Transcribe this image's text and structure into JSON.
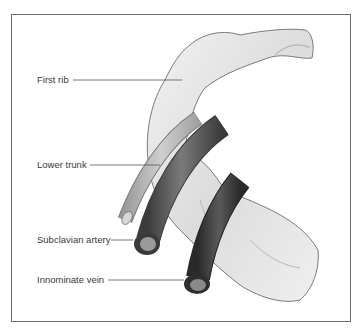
{
  "figure": {
    "type": "anatomical-illustration",
    "labels": {
      "first_rib": "First rib",
      "lower_trunk": "Lower trunk",
      "subclavian_artery": "Subclavian artery",
      "innominate_vein": "Innominate vein"
    },
    "colors": {
      "rib_fill": "#e4e4e4",
      "rib_outline": "#7a7a7a",
      "artery": "#5e5e5e",
      "vein": "#3e3e3e",
      "nerve_trunk": "#b8b8b8",
      "frame": "#6a6a6a",
      "leader_line": "#555555"
    }
  }
}
